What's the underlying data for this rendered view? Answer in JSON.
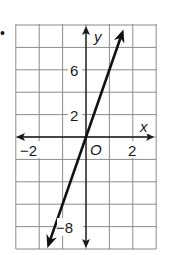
{
  "bullet": "•",
  "axes": {
    "x_label": "x",
    "y_label": "y",
    "origin_label": "O",
    "x_ticks": [
      {
        "value": -2,
        "label": "−2"
      },
      {
        "value": 2,
        "label": "2"
      }
    ],
    "y_ticks": [
      {
        "value": 6,
        "label": "6"
      },
      {
        "value": 2,
        "label": "2"
      },
      {
        "value": -8,
        "label": "−8"
      }
    ]
  },
  "colors": {
    "grid": "#8a8a8a",
    "axis": "#1a1a1a",
    "line": "#111111",
    "background": "#ffffff"
  },
  "chart_data": {
    "type": "line",
    "title": "",
    "xlabel": "x",
    "ylabel": "y",
    "equation": "y = 6x",
    "series": [
      {
        "name": "line",
        "x": [
          -1.65,
          0,
          1.6
        ],
        "y": [
          -9.9,
          0,
          9.6
        ]
      }
    ],
    "xlim": [
      -3.0,
      3.0
    ],
    "ylim": [
      -10,
      10
    ],
    "x_grid_step": 1,
    "y_grid_step": 2,
    "x_tick_labels": [
      "−2",
      "2"
    ],
    "y_tick_labels": [
      "6",
      "2",
      "−8"
    ],
    "grid": true,
    "legend": null,
    "annotations": [
      "O"
    ]
  }
}
